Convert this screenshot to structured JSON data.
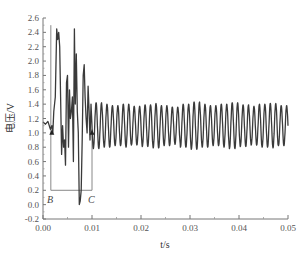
{
  "chart_data": {
    "type": "line",
    "title": "",
    "xlabel": "t/s",
    "ylabel": "电压/V",
    "xlim": [
      0.0,
      0.05
    ],
    "ylim": [
      -0.2,
      2.6
    ],
    "x_ticks": [
      "0.00",
      "0.01",
      "0.02",
      "0.03",
      "0.04",
      "0.05"
    ],
    "y_ticks": [
      "-0.2",
      "0.0",
      "0.2",
      "0.4",
      "0.6",
      "0.8",
      "1.0",
      "1.2",
      "1.4",
      "1.6",
      "1.8",
      "2.0",
      "2.2",
      "2.4",
      "2.6"
    ],
    "grid": false,
    "legend": null,
    "series": [
      {
        "name": "voltage",
        "color": "#3a3a3a",
        "description": "Disturbed interval (approx. 0.0015–0.010 s) with spikes up to ~2.45 V and dips to ~0.0 V, followed by steady oscillation ~0.8–1.45 V",
        "x": [
          0.0,
          0.0005,
          0.001,
          0.0015,
          0.0018,
          0.002,
          0.0022,
          0.0025,
          0.0028,
          0.003,
          0.0032,
          0.0034,
          0.0036,
          0.0038,
          0.004,
          0.0042,
          0.0044,
          0.0046,
          0.0048,
          0.005,
          0.0052,
          0.0054,
          0.0056,
          0.0058,
          0.006,
          0.0062,
          0.0064,
          0.0066,
          0.0068,
          0.007,
          0.0072,
          0.0074,
          0.0076,
          0.0078,
          0.008,
          0.0082,
          0.0084,
          0.0086,
          0.0088,
          0.009,
          0.0092,
          0.0094,
          0.0096,
          0.0098,
          0.01
        ],
        "y": [
          1.15,
          1.12,
          1.16,
          1.05,
          1.1,
          1.0,
          1.3,
          1.5,
          2.45,
          2.3,
          2.4,
          2.2,
          1.5,
          0.7,
          1.1,
          0.8,
          0.9,
          0.55,
          1.7,
          1.8,
          0.8,
          1.6,
          1.2,
          1.3,
          1.5,
          0.6,
          2.45,
          1.4,
          2.1,
          1.3,
          1.0,
          0.0,
          0.05,
          0.2,
          0.9,
          1.8,
          1.95,
          1.5,
          1.2,
          1.0,
          1.65,
          1.3,
          0.9,
          1.4,
          1.1
        ],
        "steady_state": {
          "t_start": 0.01,
          "t_end": 0.05,
          "mean": 1.1,
          "amplitude": 0.3,
          "frequency_hz": 900
        }
      }
    ],
    "annotations": [
      {
        "type": "rectangle",
        "x0": 0.0016,
        "x1": 0.01,
        "y_bottom": 0.2,
        "y_top": 2.6
      },
      {
        "type": "label",
        "text": "B",
        "x": 0.0016,
        "y": 0.1
      },
      {
        "type": "label",
        "text": "C",
        "x": 0.01,
        "y": 0.1
      },
      {
        "type": "marker",
        "shape": "triangle",
        "x": 0.0018,
        "y": 1.0
      },
      {
        "type": "marker",
        "shape": "triangle",
        "x": 0.01,
        "y": 1.0
      }
    ]
  },
  "labels": {
    "xlabel": "t/s",
    "ylabel": "电压/V",
    "B": "B",
    "C": "C"
  }
}
